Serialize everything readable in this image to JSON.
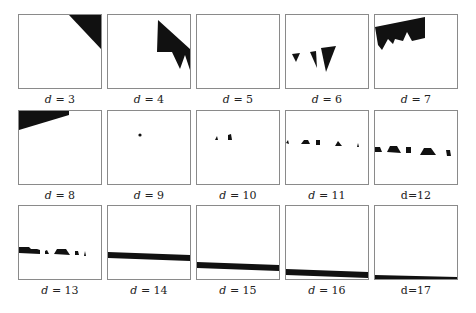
{
  "figure": {
    "border_color": "#8a8a8a",
    "fill_color": "#111111",
    "panels": [
      {
        "label": "d = 3",
        "var": "d",
        "value": "3",
        "italic": true
      },
      {
        "label": "d = 4",
        "var": "d",
        "value": "4",
        "italic": true
      },
      {
        "label": "d = 5",
        "var": "d",
        "value": "5",
        "italic": true
      },
      {
        "label": "d = 6",
        "var": "d",
        "value": "6",
        "italic": true
      },
      {
        "label": "d = 7",
        "var": "d",
        "value": "7",
        "italic": true
      },
      {
        "label": "d = 8",
        "var": "d",
        "value": "8",
        "italic": true
      },
      {
        "label": "d = 9",
        "var": "d",
        "value": "9",
        "italic": true
      },
      {
        "label": "d = 10",
        "var": "d",
        "value": "10",
        "italic": true
      },
      {
        "label": "d = 11",
        "var": "d",
        "value": "11",
        "italic": true
      },
      {
        "label": "d=12",
        "var": "d",
        "value": "12",
        "italic": false
      },
      {
        "label": "d = 13",
        "var": "d",
        "value": "13",
        "italic": true
      },
      {
        "label": "d = 14",
        "var": "d",
        "value": "14",
        "italic": true
      },
      {
        "label": "d = 15",
        "var": "d",
        "value": "15",
        "italic": true
      },
      {
        "label": "d = 16",
        "var": "d",
        "value": "16",
        "italic": true
      },
      {
        "label": "d=17",
        "var": "d",
        "value": "17",
        "italic": false
      }
    ]
  }
}
